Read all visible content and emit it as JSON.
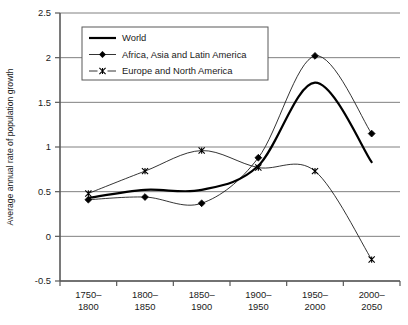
{
  "chart_data": {
    "type": "line",
    "title": "",
    "xlabel": "",
    "ylabel": "Average annual rate of population growth",
    "categories": [
      "1750–\n1800",
      "1800–\n1850",
      "1850–\n1900",
      "1900–\n1950",
      "1950–\n2000",
      "2000–\n2050"
    ],
    "category_lines": [
      [
        "1750–",
        "1800"
      ],
      [
        "1800–",
        "1850"
      ],
      [
        "1850–",
        "1900"
      ],
      [
        "1900–",
        "1950"
      ],
      [
        "1950–",
        "2000"
      ],
      [
        "2000–",
        "2050"
      ]
    ],
    "ylim": [
      -0.5,
      2.5
    ],
    "yticks": [
      -0.5,
      0,
      0.5,
      1,
      1.5,
      2,
      2.5
    ],
    "ytick_labels": [
      "-0.5",
      "0",
      "0.5",
      "1",
      "1.5",
      "2",
      "2.5"
    ],
    "grid": true,
    "grid_axis": "y",
    "legend_position": "upper-left-inside",
    "smoothing": "spline",
    "series": [
      {
        "name": "World",
        "marker": "none",
        "line_width": 2.2,
        "color": "#000000",
        "values": [
          0.43,
          0.52,
          0.52,
          0.79,
          1.72,
          0.83
        ]
      },
      {
        "name": "Africa, Asia and Latin America",
        "marker": "diamond",
        "line_width": 0.8,
        "color": "#000000",
        "values": [
          0.41,
          0.44,
          0.37,
          0.88,
          2.02,
          1.15
        ]
      },
      {
        "name": "Europe and North America",
        "marker": "x",
        "line_width": 0.8,
        "color": "#000000",
        "values": [
          0.48,
          0.73,
          0.96,
          0.77,
          0.73,
          -0.26
        ]
      }
    ]
  },
  "legend": {
    "entries": [
      {
        "label": "World",
        "marker": "line-thick"
      },
      {
        "label": "Africa, Asia and Latin America",
        "marker": "diamond"
      },
      {
        "label": "Europe and North America",
        "marker": "x-dash"
      }
    ]
  },
  "colors": {
    "axis": "#595959",
    "grid": "#808080",
    "ink": "#1a1a1a",
    "series": "#000000",
    "background": "#ffffff"
  }
}
